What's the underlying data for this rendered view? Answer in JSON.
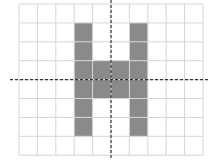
{
  "diagram": {
    "type": "grid-shape-with-symmetry-axes",
    "grid": {
      "columns": 10,
      "rows": 8,
      "left": 19,
      "top": 4,
      "cell_width": 18.4,
      "cell_height": 18.9,
      "line_color": "#d6d6d6",
      "background": "#ffffff"
    },
    "shaded_color": "#8a8a8a",
    "shaded_cells": [
      [
        3,
        1
      ],
      [
        3,
        2
      ],
      [
        3,
        3
      ],
      [
        3,
        4
      ],
      [
        3,
        5
      ],
      [
        3,
        6
      ],
      [
        6,
        1
      ],
      [
        6,
        2
      ],
      [
        6,
        3
      ],
      [
        6,
        4
      ],
      [
        6,
        5
      ],
      [
        6,
        6
      ],
      [
        4,
        3
      ],
      [
        5,
        3
      ],
      [
        4,
        4
      ],
      [
        5,
        4
      ]
    ],
    "axes": {
      "color": "#333333",
      "vertical": {
        "x": 111,
        "y1": 0,
        "y2": 160
      },
      "horizontal": {
        "y": 79.6,
        "x1": 10,
        "x2": 210
      },
      "dash": "3,2"
    }
  }
}
